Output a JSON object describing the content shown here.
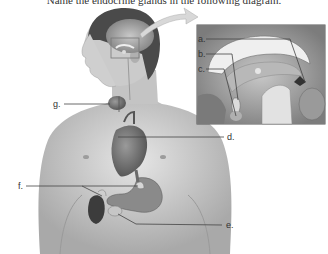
{
  "header": {
    "text": "Name the endocrine glands in the following diagram."
  },
  "labels": {
    "a": "a.",
    "b": "b.",
    "c": "c.",
    "d": "d.",
    "e": "e.",
    "f": "f.",
    "g": "g."
  },
  "colors": {
    "skin": "#d2d2d2",
    "skin_dark": "#a8a8a8",
    "hair": "#4a4a4a",
    "organ": "#6b6b6b",
    "inset_border": "#555555",
    "leader_line": "#444444"
  }
}
